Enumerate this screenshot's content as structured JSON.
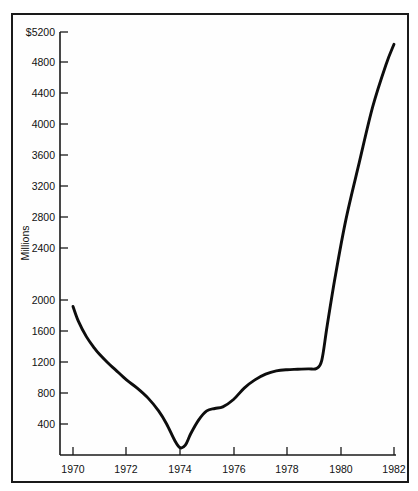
{
  "chart_data": {
    "type": "line",
    "title": "",
    "subtitle": "",
    "xlabel": "",
    "ylabel": "Millions",
    "yunit_prefix": "$",
    "xlim": [
      1969.4,
      1982.4
    ],
    "ylim": [
      0,
      5200
    ],
    "grid": false,
    "legend": null,
    "x_ticks": [
      1970,
      1972,
      1974,
      1976,
      1978,
      1980,
      1982
    ],
    "x_tick_labels": [
      "1970",
      "1972",
      "1974",
      "1976",
      "1978",
      "1980",
      "1982"
    ],
    "y_ticks": [
      400,
      800,
      1200,
      1600,
      2000,
      2400,
      2800,
      3200,
      3600,
      4000,
      4400,
      4800,
      5200
    ],
    "y_tick_labels": [
      "400",
      "800",
      "1200",
      "1600",
      "2000",
      "2400",
      "2800",
      "3200",
      "3600",
      "4000",
      "4400",
      "4800",
      "$5200"
    ],
    "series": [
      {
        "name": "Value",
        "color": "#0d0d0d",
        "x": [
          1970.0,
          1970.2,
          1970.5,
          1970.8,
          1971.0,
          1971.3,
          1971.6,
          1972.0,
          1972.4,
          1972.8,
          1973.2,
          1973.5,
          1973.8,
          1974.0,
          1974.2,
          1974.4,
          1974.7,
          1975.0,
          1975.3,
          1975.6,
          1976.0,
          1976.4,
          1976.8,
          1977.2,
          1977.6,
          1978.0,
          1978.4,
          1978.8,
          1979.1,
          1979.3,
          1979.5,
          1979.8,
          1980.2,
          1980.7,
          1981.2,
          1981.7,
          1982.0
        ],
        "y": [
          1840,
          1660,
          1470,
          1330,
          1250,
          1150,
          1060,
          940,
          840,
          720,
          560,
          400,
          200,
          110,
          140,
          280,
          450,
          560,
          590,
          610,
          700,
          840,
          940,
          1010,
          1050,
          1065,
          1070,
          1075,
          1080,
          1180,
          1600,
          2200,
          2900,
          3600,
          4280,
          4800,
          5050
        ]
      }
    ],
    "annotations": [],
    "key_points": {
      "start_1970": 1840,
      "minimum_1974": 110,
      "plateau_1975_1976": 600,
      "plateau_1978_1979": 1070,
      "end_1982": 5050
    }
  }
}
